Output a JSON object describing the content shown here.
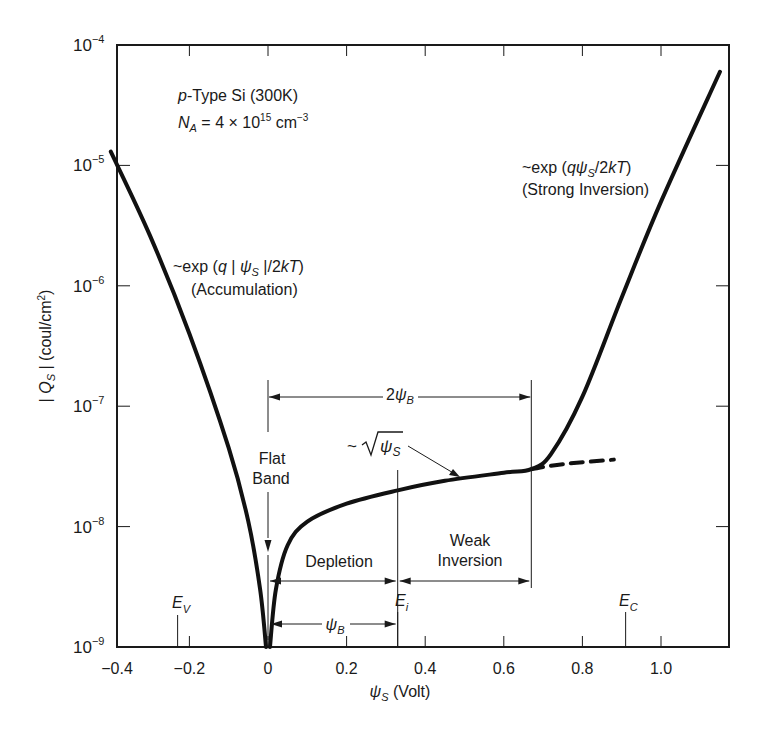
{
  "chart_data": {
    "type": "line",
    "title": "",
    "annotation_material": "p-Type Si (300K)",
    "annotation_doping": {
      "prefix": "N",
      "sub": "A",
      "text": " = 4 × 10",
      "exp": "15",
      "unit": " cm",
      "unit_exp": "−3"
    },
    "xlabel": "ψS (Volt)",
    "xlabel_parts": {
      "sym": "ψ",
      "sub": "S",
      "rest": " (Volt)"
    },
    "ylabel": "| QS | (coul/cm²)",
    "ylabel_parts": {
      "pre": "| Q",
      "sub": "S",
      "rest": " | (coul/cm",
      "sup": "2",
      "end": ")"
    },
    "xlim": [
      -0.4,
      1.15
    ],
    "ylim": [
      1e-09,
      0.0001
    ],
    "yscale": "log",
    "grid": false,
    "x_ticks": [
      {
        "v": -0.4,
        "label": "−0.4"
      },
      {
        "v": -0.2,
        "label": "−0.2"
      },
      {
        "v": 0,
        "label": "0"
      },
      {
        "v": 0.2,
        "label": "0.2"
      },
      {
        "v": 0.4,
        "label": "0.4"
      },
      {
        "v": 0.6,
        "label": "0.6"
      },
      {
        "v": 0.8,
        "label": "0.8"
      },
      {
        "v": 1.0,
        "label": "1.0"
      }
    ],
    "y_ticks": [
      {
        "exp": -4,
        "label": "10",
        "sup": "−4"
      },
      {
        "exp": -5,
        "label": "10",
        "sup": "−5"
      },
      {
        "exp": -6,
        "label": "10",
        "sup": "−6"
      },
      {
        "exp": -7,
        "label": "10",
        "sup": "−7"
      },
      {
        "exp": -8,
        "label": "10",
        "sup": "−8"
      },
      {
        "exp": -9,
        "label": "10",
        "sup": "−9"
      }
    ],
    "series": [
      {
        "name": "accumulation branch",
        "style": "solid",
        "x": [
          -0.4,
          -0.3,
          -0.2,
          -0.1,
          -0.05,
          -0.02,
          -0.005
        ],
        "y": [
          1.3e-05,
          2.6e-06,
          4e-07,
          4.5e-08,
          1.1e-08,
          3e-09,
          1e-09
        ]
      },
      {
        "name": "depletion / weak / strong inversion branch",
        "style": "solid",
        "x": [
          0.005,
          0.02,
          0.05,
          0.1,
          0.2,
          0.33,
          0.45,
          0.6,
          0.67,
          0.72,
          0.8,
          0.9,
          1.0,
          1.15
        ],
        "y": [
          1e-09,
          3e-09,
          7e-09,
          1.1e-08,
          1.55e-08,
          2e-08,
          2.4e-08,
          2.8e-08,
          3e-08,
          4e-08,
          1.2e-07,
          8e-07,
          5e-06,
          6e-05
        ]
      },
      {
        "name": "depletion extrapolation (√ψS)",
        "style": "dashed",
        "x": [
          0.67,
          0.75,
          0.88
        ],
        "y": [
          3e-08,
          3.3e-08,
          3.6e-08
        ]
      }
    ],
    "annotations": {
      "accumulation_formula": "~exp (q | ψS |/2kT)",
      "accumulation_label": "(Accumulation)",
      "strong_formula": "~exp (qψS/2kT)",
      "strong_label": "(Strong Inversion)",
      "sqrt_label": "~√ψS",
      "two_psi_b": "2ψB",
      "psi_b": "ψB",
      "flat_line1": "Flat",
      "flat_line2": "Band",
      "depletion": "Depletion",
      "weak_line1": "Weak",
      "weak_line2": "Inversion",
      "ev": "E",
      "ev_sub": "V",
      "ei": "E",
      "ei_sub": "i",
      "ec": "E",
      "ec_sub": "C",
      "ev_x": -0.23,
      "ei_x": 0.33,
      "ec_x": 0.91,
      "two_psi_b_end_x": 0.67
    }
  }
}
